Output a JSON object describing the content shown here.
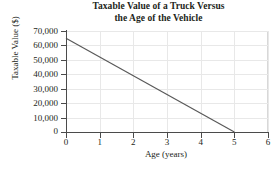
{
  "chart_data": {
    "type": "line",
    "title": "Taxable Value of a Truck Versus the Age of the Vehicle",
    "title_line1": "Taxable Value of a Truck Versus",
    "title_line2": "the Age of the Vehicle",
    "xlabel": "Age (years)",
    "ylabel": "Taxable Value ($)",
    "xlim": [
      0,
      6
    ],
    "ylim": [
      0,
      70000
    ],
    "grid": true,
    "legend": null,
    "xticks": [
      0,
      1,
      2,
      3,
      4,
      5,
      6
    ],
    "xtick_labels": [
      "0",
      "1",
      "2",
      "3",
      "4",
      "5",
      "6"
    ],
    "yticks": [
      0,
      10000,
      20000,
      30000,
      40000,
      50000,
      60000,
      70000
    ],
    "ytick_labels": [
      "0",
      "10,000",
      "20,000",
      "30,000",
      "40,000",
      "50,000",
      "60,000",
      "70,000"
    ],
    "origin_label_y": "0",
    "origin_label_x": "0",
    "series": [
      {
        "name": "Taxable Value",
        "color": "#595959",
        "x": [
          0,
          5
        ],
        "values": [
          65000,
          0
        ],
        "points": [
          [
            0,
            65000
          ],
          [
            5,
            0
          ]
        ]
      }
    ],
    "colors": {
      "axis": "#4b4b4b",
      "grid": "#e8e8e8",
      "line": "#595959",
      "text": "#231f20",
      "background": "#ffffff"
    }
  }
}
